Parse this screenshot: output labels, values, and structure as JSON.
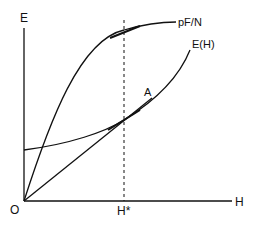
{
  "diagram": {
    "axes": {
      "y_label": "E",
      "x_label": "H",
      "origin_label": "O"
    },
    "marker": {
      "label": "H*",
      "style": "dashed-vertical"
    },
    "curves": [
      {
        "name": "pF/N",
        "label": "pF/N",
        "shape": "concave rising from origin"
      },
      {
        "name": "E(H)",
        "label": "E(H)",
        "shape": "convex rising with positive intercept"
      }
    ],
    "ray": {
      "label": "A",
      "from": "O"
    },
    "colors": {
      "line": "#111111",
      "background": "#ffffff"
    }
  }
}
